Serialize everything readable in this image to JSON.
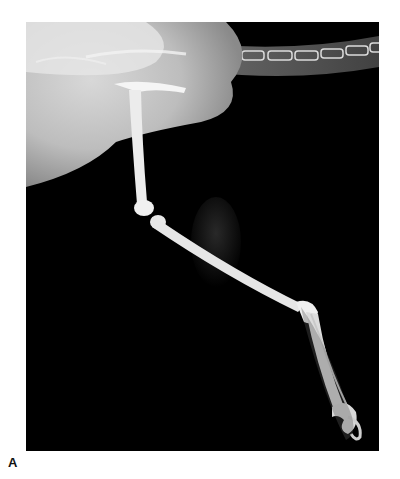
{
  "figure": {
    "panel_label": "A",
    "colors": {
      "background": "#000000",
      "bone": "#e8e8e8",
      "soft_tissue": "#9a9a9a",
      "page": "#ffffff"
    }
  }
}
